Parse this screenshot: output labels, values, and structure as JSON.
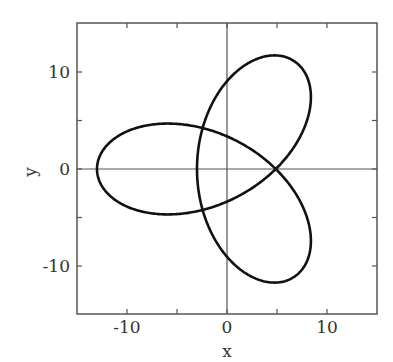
{
  "chart_data": {
    "type": "line",
    "title": "",
    "xlabel": "x",
    "ylabel": "y",
    "xlim": [
      -15,
      15
    ],
    "ylim": [
      -15,
      15
    ],
    "xticks": [
      -10,
      0,
      10
    ],
    "yticks": [
      10,
      0,
      -10
    ],
    "xtick_labels": [
      "-10",
      "0",
      "10"
    ],
    "ytick_labels": [
      "10",
      "0",
      "-10"
    ],
    "minor_ticks": [
      -15,
      -10,
      -5,
      0,
      5,
      10,
      15
    ],
    "grid": false,
    "axes_lines_through_origin": true,
    "series": [
      {
        "name": "parametric curve",
        "parametric": "x = -(5 cos t + 8 cos 2t), y = -(5 sin t - 8 sin 2t), t in [0, 2pi]",
        "key_points": {
          "leftmost": [
            -13,
            0
          ],
          "inner_right_loop_min_x": [
            3,
            0
          ],
          "right_crossing": [
            9.6,
            0
          ],
          "top": [
            2.3,
            12.5
          ],
          "bottom": [
            2.3,
            -12.5
          ],
          "upper_left_lobe_top": [
            -4,
            8.3
          ],
          "lower_left_lobe_bottom": [
            -4,
            -8.3
          ]
        }
      }
    ],
    "legend": null
  },
  "labels": {
    "x_axis": "x",
    "y_axis": "y",
    "xticks": [
      "-10",
      "0",
      "10"
    ],
    "yticks": [
      "10",
      "0",
      "-10"
    ]
  }
}
